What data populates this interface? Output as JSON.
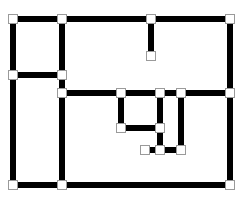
{
  "diagram": {
    "type": "graph",
    "colors": {
      "edge": "#000000",
      "node_fill": "#ffffff",
      "node_stroke": "#9a9a9a",
      "background": "#ffffff"
    },
    "nodes": [
      {
        "id": "n1"
      },
      {
        "id": "n2"
      },
      {
        "id": "n3"
      },
      {
        "id": "n4"
      },
      {
        "id": "n5"
      },
      {
        "id": "n6"
      },
      {
        "id": "n7"
      },
      {
        "id": "n8"
      },
      {
        "id": "n9"
      },
      {
        "id": "n10"
      },
      {
        "id": "n11"
      },
      {
        "id": "n12"
      },
      {
        "id": "n13"
      },
      {
        "id": "n14"
      },
      {
        "id": "n15"
      },
      {
        "id": "n16"
      },
      {
        "id": "n17"
      },
      {
        "id": "n18"
      },
      {
        "id": "n19"
      },
      {
        "id": "n20"
      }
    ],
    "edges": [
      [
        "n1",
        "n2"
      ],
      [
        "n2",
        "n3"
      ],
      [
        "n3",
        "n4"
      ],
      [
        "n3",
        "n5"
      ],
      [
        "n1",
        "n6"
      ],
      [
        "n6",
        "n18"
      ],
      [
        "n2",
        "n7"
      ],
      [
        "n7",
        "n8"
      ],
      [
        "n6",
        "n7"
      ],
      [
        "n8",
        "n19"
      ],
      [
        "n8",
        "n9"
      ],
      [
        "n9",
        "n10"
      ],
      [
        "n10",
        "n11"
      ],
      [
        "n11",
        "n12"
      ],
      [
        "n4",
        "n12"
      ],
      [
        "n12",
        "n20"
      ],
      [
        "n9",
        "n13"
      ],
      [
        "n13",
        "n14"
      ],
      [
        "n10",
        "n14"
      ],
      [
        "n14",
        "n16"
      ],
      [
        "n15",
        "n16"
      ],
      [
        "n16",
        "n17"
      ],
      [
        "n11",
        "n17"
      ],
      [
        "n18",
        "n19"
      ],
      [
        "n19",
        "n20"
      ]
    ]
  }
}
